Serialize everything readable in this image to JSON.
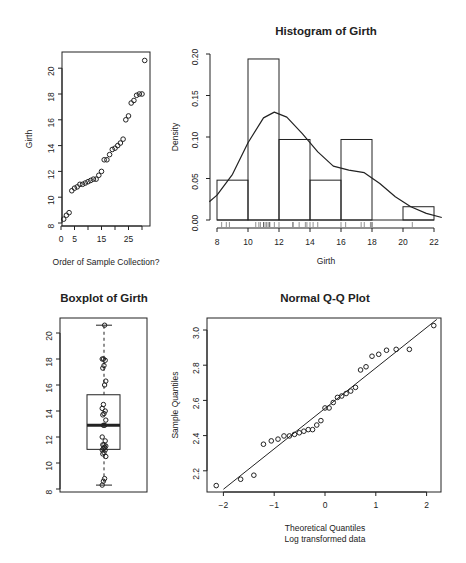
{
  "chart_data": [
    {
      "type": "scatter",
      "title": "",
      "xlabel": "Order of Sample Collection?",
      "ylabel": "Girth",
      "x_ticks": [
        "0",
        "5",
        "15",
        "25"
      ],
      "y_ticks": [
        "8",
        "10",
        "12",
        "14",
        "16",
        "18",
        "20"
      ],
      "xlim": [
        0,
        31
      ],
      "ylim": [
        8,
        21
      ],
      "x": [
        1,
        2,
        3,
        4,
        5,
        6,
        7,
        8,
        9,
        10,
        11,
        12,
        13,
        14,
        15,
        16,
        17,
        18,
        19,
        20,
        21,
        22,
        23,
        24,
        25,
        26,
        27,
        28,
        29,
        30,
        31
      ],
      "y": [
        8.3,
        8.6,
        8.8,
        10.5,
        10.7,
        10.8,
        11.0,
        11.0,
        11.1,
        11.2,
        11.3,
        11.4,
        11.4,
        11.7,
        12.0,
        12.9,
        12.9,
        13.3,
        13.7,
        13.8,
        14.0,
        14.2,
        14.5,
        16.0,
        16.3,
        17.3,
        17.5,
        17.9,
        18.0,
        18.0,
        20.6
      ]
    },
    {
      "type": "bar",
      "title": "Histogram of Girth",
      "xlabel": "Girth",
      "ylabel": "Density",
      "x_ticks": [
        "8",
        "10",
        "12",
        "14",
        "16",
        "18",
        "20",
        "22"
      ],
      "y_ticks": [
        "0.00",
        "0.05",
        "0.10",
        "0.15",
        "0.20"
      ],
      "bins": [
        [
          8,
          10
        ],
        [
          10,
          12
        ],
        [
          12,
          14
        ],
        [
          14,
          16
        ],
        [
          16,
          18
        ],
        [
          18,
          20
        ],
        [
          20,
          22
        ]
      ],
      "values": [
        0.048,
        0.194,
        0.097,
        0.048,
        0.097,
        0.0,
        0.016
      ],
      "density_curve": {
        "x": [
          7.5,
          8,
          9,
          10,
          11,
          11.7,
          12.5,
          13.5,
          14.5,
          15.5,
          16.5,
          17.5,
          18.5,
          19.5,
          20.5,
          21.5,
          22.5
        ],
        "y": [
          0.022,
          0.03,
          0.055,
          0.093,
          0.123,
          0.13,
          0.124,
          0.104,
          0.082,
          0.065,
          0.06,
          0.057,
          0.044,
          0.028,
          0.016,
          0.008,
          0.003
        ]
      },
      "rug": [
        8.3,
        8.6,
        8.8,
        10.5,
        10.7,
        10.8,
        11.0,
        11.0,
        11.1,
        11.2,
        11.3,
        11.4,
        11.4,
        11.7,
        12.0,
        12.9,
        12.9,
        13.3,
        13.7,
        13.8,
        14.0,
        14.2,
        14.5,
        16.0,
        16.3,
        17.3,
        17.5,
        17.9,
        18.0,
        18.0,
        20.6
      ],
      "ylim": [
        0,
        0.2
      ]
    },
    {
      "type": "box",
      "title": "Boxplot of Girth",
      "y_ticks": [
        "8",
        "10",
        "12",
        "14",
        "16",
        "18",
        "20"
      ],
      "min": 8.3,
      "q1": 11.05,
      "median": 12.9,
      "q3": 15.25,
      "max": 20.6,
      "points": [
        8.3,
        8.6,
        8.8,
        10.5,
        10.7,
        10.8,
        11.0,
        11.0,
        11.1,
        11.2,
        11.3,
        11.4,
        11.4,
        11.7,
        12.0,
        12.9,
        12.9,
        13.3,
        13.7,
        13.8,
        14.0,
        14.2,
        14.5,
        16.0,
        16.3,
        17.3,
        17.5,
        17.9,
        18.0,
        18.0,
        20.6
      ]
    },
    {
      "type": "scatter",
      "title": "Normal Q-Q Plot",
      "xlabel": "Theoretical Quantiles",
      "xlabel2": "Log transformed data",
      "ylabel": "Sample Quantiles",
      "x_ticks": [
        "-2",
        "-1",
        "0",
        "1",
        "2"
      ],
      "y_ticks": [
        "2.2",
        "2.4",
        "2.6",
        "2.8",
        "3.0"
      ],
      "x": [
        -2.14,
        -1.66,
        -1.4,
        -1.21,
        -1.05,
        -0.91,
        -0.79,
        -0.68,
        -0.57,
        -0.47,
        -0.37,
        -0.28,
        -0.2,
        -0.12,
        -0.04,
        0.04,
        0.12,
        0.2,
        0.28,
        0.37,
        0.47,
        0.57,
        0.68,
        0.79,
        0.91,
        1.05,
        1.21,
        1.4,
        1.66,
        2.14
      ],
      "y": [
        2.116,
        2.152,
        2.175,
        2.351,
        2.37,
        2.38,
        2.398,
        2.398,
        2.407,
        2.416,
        2.425,
        2.434,
        2.434,
        2.46,
        2.485,
        2.557,
        2.557,
        2.588,
        2.617,
        2.625,
        2.639,
        2.653,
        2.674,
        2.773,
        2.791,
        2.851,
        2.862,
        2.885,
        2.89,
        2.89,
        3.025
      ],
      "reference_line": {
        "x1": -2.0,
        "y1": 2.095,
        "x2": 2.2,
        "y2": 3.06
      }
    }
  ]
}
